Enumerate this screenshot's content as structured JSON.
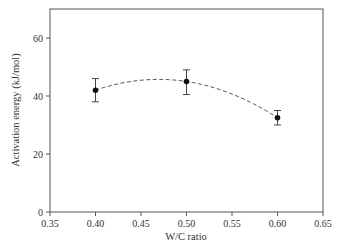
{
  "chart_data": {
    "type": "line",
    "title": "",
    "xlabel": "W/C ratio",
    "ylabel": "Activation energy (kJ/mol)",
    "xlim": [
      0.35,
      0.65
    ],
    "ylim": [
      0,
      70
    ],
    "x_ticks": [
      "0.35",
      "0.40",
      "0.45",
      "0.50",
      "0.55",
      "0.60",
      "0.65"
    ],
    "y_ticks": [
      "0",
      "20",
      "40",
      "60"
    ],
    "grid": false,
    "legend": null,
    "series": [
      {
        "name": "Activation energy",
        "marker": "filled-circle",
        "x": [
          0.4,
          0.5,
          0.6
        ],
        "values": [
          42,
          45,
          32.5
        ],
        "error_upper": [
          46,
          49,
          35
        ],
        "error_lower": [
          38,
          40.5,
          30
        ]
      }
    ],
    "trend_line": {
      "style": "dashed",
      "type": "quadratic fit",
      "x_range": [
        0.4,
        0.6
      ],
      "peak_approx": {
        "x": 0.465,
        "y": 45.8
      }
    }
  }
}
